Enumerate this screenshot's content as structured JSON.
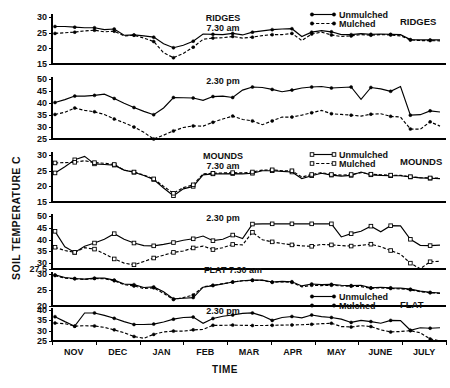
{
  "figure": {
    "y_axis_title": "SOIL TEMPERATURE C",
    "x_axis_title": "TIME",
    "x_tick_labels": [
      "NOV",
      "DEC",
      "JAN",
      "FEB",
      "MAR",
      "APR",
      "MAY",
      "JUNE",
      "JULY"
    ],
    "legend": {
      "unmulched": "Unmulched",
      "mulched": "Mulched"
    },
    "group_labels": {
      "ridges": "RIDGES",
      "mounds": "MOUNDS",
      "flat": "FLAT"
    },
    "panel_titles": {
      "ridges_am": "RIDGES\n7.30 am",
      "ridges_pm": "2.30 pm",
      "mounds_am": "MOUNDS\n7.30 am",
      "mounds_pm": "2.30 pm",
      "flat_am": "FLAT 7.30 am",
      "flat_pm": "2.30 pm"
    },
    "ink_color": "#000000",
    "background_color": "#ffffff"
  },
  "chart_data": {
    "type": "line",
    "xlabel": "TIME",
    "ylabel": "SOIL TEMPERATURE C",
    "grid": false,
    "legend_position": "top-right of each group",
    "x_categories": [
      "NOV",
      "DEC",
      "JAN",
      "FEB",
      "MAR",
      "APR",
      "MAY",
      "JUNE",
      "JULY"
    ],
    "x_range": [
      0,
      39
    ],
    "panels": [
      {
        "id": "ridges_am",
        "title": "RIDGES 7.30 am",
        "group": "RIDGES",
        "time_of_day": "7.30 am",
        "marker": "filled",
        "ylim": [
          15,
          31
        ],
        "yticks": [
          30,
          25,
          20,
          15
        ],
        "series": [
          {
            "name": "Unmulched",
            "style": "solid",
            "values": [
              27.0,
              27.0,
              26.8,
              26.6,
              26.6,
              26.0,
              26.2,
              24.2,
              24.3,
              24.0,
              23.6,
              21.5,
              20.2,
              21.0,
              22.3,
              24.6,
              24.5,
              24.4,
              24.8,
              24.3,
              25.2,
              25.6,
              26.0,
              26.2,
              26.3,
              23.8,
              25.2,
              25.7,
              25.3,
              24.4,
              24.4,
              24.7,
              24.5,
              24.6,
              24.5,
              24.4,
              22.8,
              22.7,
              22.7,
              22.7
            ]
          },
          {
            "name": "Mulched",
            "style": "dashed",
            "values": [
              24.8,
              25.0,
              25.2,
              25.6,
              25.8,
              25.3,
              25.5,
              24.0,
              24.2,
              23.3,
              22.2,
              18.6,
              17.0,
              18.4,
              20.4,
              22.9,
              23.3,
              23.4,
              23.8,
              23.3,
              23.6,
              24.1,
              24.4,
              24.4,
              24.8,
              22.5,
              24.6,
              25.2,
              24.3,
              23.8,
              24.0,
              24.4,
              24.2,
              24.4,
              24.3,
              24.0,
              22.7,
              22.5,
              22.5,
              22.4
            ]
          }
        ]
      },
      {
        "id": "ridges_pm",
        "title": "2.30 pm",
        "group": "RIDGES",
        "time_of_day": "2.30 pm",
        "marker": "filled",
        "ylim": [
          25,
          51
        ],
        "yticks": [
          50,
          45,
          40,
          35,
          30,
          25
        ],
        "series": [
          {
            "name": "Unmulched",
            "style": "solid",
            "values": [
              40.3,
              41.5,
              43.0,
              43.0,
              43.3,
              43.8,
              42.0,
              40.0,
              38.2,
              36.6,
              35.2,
              38.0,
              42.4,
              42.3,
              42.2,
              41.2,
              42.8,
              43.0,
              42.4,
              45.5,
              46.8,
              46.6,
              45.8,
              44.8,
              45.5,
              46.4,
              46.8,
              47.0,
              46.4,
              46.6,
              46.8,
              41.6,
              46.6,
              46.0,
              45.0,
              47.0,
              35.0,
              35.2,
              36.8,
              36.3
            ]
          },
          {
            "name": "Mulched",
            "style": "dashed",
            "values": [
              35.3,
              36.2,
              38.0,
              37.0,
              36.4,
              35.3,
              33.4,
              31.8,
              30.0,
              27.8,
              25.0,
              26.6,
              28.4,
              29.8,
              30.5,
              30.4,
              32.0,
              33.4,
              34.6,
              33.2,
              32.6,
              31.0,
              32.6,
              34.2,
              34.2,
              35.0,
              36.0,
              37.0,
              35.6,
              35.3,
              35.0,
              34.6,
              35.4,
              35.6,
              34.5,
              34.2,
              29.2,
              29.1,
              32.2,
              30.4
            ]
          }
        ]
      },
      {
        "id": "mounds_am",
        "title": "MOUNDS 7.30 am",
        "group": "MOUNDS",
        "time_of_day": "7.30 am",
        "marker": "open",
        "ylim": [
          15,
          31
        ],
        "yticks": [
          30,
          25,
          20,
          15
        ],
        "series": [
          {
            "name": "Unmulched",
            "style": "solid",
            "values": [
              24.3,
              26.3,
              28.5,
              29.6,
              27.2,
              27.0,
              26.8,
              25.2,
              24.5,
              23.5,
              22.2,
              19.5,
              17.0,
              19.2,
              20.0,
              23.7,
              24.0,
              24.0,
              24.1,
              24.0,
              24.2,
              25.0,
              25.0,
              24.8,
              24.6,
              22.5,
              23.4,
              24.2,
              23.6,
              23.3,
              23.5,
              24.6,
              23.7,
              23.5,
              23.4,
              23.4,
              23.0,
              22.7,
              22.6,
              22.5
            ]
          },
          {
            "name": "Mulched",
            "style": "dashed",
            "values": [
              27.5,
              27.6,
              27.7,
              28.2,
              27.6,
              27.4,
              27.0,
              25.2,
              24.6,
              23.6,
              22.4,
              20.0,
              17.8,
              19.6,
              20.5,
              24.0,
              24.2,
              24.3,
              24.4,
              24.3,
              24.6,
              25.2,
              25.3,
              25.0,
              25.0,
              23.0,
              23.8,
              24.4,
              23.8,
              23.6,
              23.8,
              24.4,
              23.9,
              23.7,
              23.6,
              23.5,
              23.1,
              22.8,
              22.7,
              22.6
            ]
          }
        ]
      },
      {
        "id": "mounds_pm",
        "title": "2.30 pm",
        "group": "MOUNDS",
        "time_of_day": "2.30 pm",
        "marker": "open",
        "ylim": [
          27.5,
          51
        ],
        "yticks": [
          50,
          45,
          40,
          35,
          30,
          27.5
        ],
        "series": [
          {
            "name": "Unmulched",
            "style": "solid",
            "values": [
              43.6,
              37.0,
              34.6,
              37.2,
              38.6,
              40.2,
              42.6,
              40.2,
              38.6,
              37.5,
              37.4,
              38.0,
              38.8,
              39.8,
              40.4,
              41.6,
              39.6,
              40.2,
              42.0,
              40.5,
              46.7,
              46.8,
              46.8,
              46.8,
              46.8,
              46.8,
              46.8,
              46.8,
              46.8,
              41.2,
              42.6,
              43.6,
              45.8,
              43.4,
              46.0,
              45.9,
              40.2,
              37.6,
              37.5,
              37.7
            ]
          },
          {
            "name": "Mulched",
            "style": "dashed",
            "values": [
              36.8,
              35.4,
              34.6,
              36.6,
              36.0,
              34.0,
              31.8,
              30.0,
              29.3,
              30.7,
              32.2,
              33.4,
              34.6,
              35.2,
              36.5,
              37.3,
              35.8,
              36.6,
              38.0,
              37.8,
              43.2,
              40.0,
              39.1,
              38.4,
              37.8,
              37.4,
              37.2,
              38.0,
              37.8,
              37.5,
              37.3,
              37.6,
              38.1,
              37.0,
              35.4,
              33.8,
              30.0,
              27.6,
              30.6,
              30.8
            ]
          }
        ]
      },
      {
        "id": "flat_am",
        "title": "FLAT 7.30 am",
        "group": "FLAT",
        "time_of_day": "7.30 am",
        "marker": "filled",
        "ylim": [
          20,
          30.5
        ],
        "yticks": [
          30,
          25,
          20
        ],
        "series": [
          {
            "name": "Unmulched",
            "style": "solid",
            "values": [
              29.6,
              28.8,
              28.5,
              28.3,
              28.6,
              28.6,
              28.0,
              26.8,
              26.6,
              25.7,
              25.9,
              24.4,
              22.2,
              22.4,
              22.6,
              25.8,
              26.3,
              26.8,
              27.4,
              27.8,
              28.0,
              28.0,
              27.4,
              27.6,
              27.5,
              26.2,
              26.8,
              26.6,
              26.7,
              26.4,
              26.3,
              26.4,
              25.6,
              25.8,
              25.6,
              25.5,
              25.2,
              24.6,
              24.2,
              24.0
            ]
          },
          {
            "name": "Mulched",
            "style": "dashed",
            "values": [
              29.4,
              28.6,
              28.4,
              28.2,
              28.5,
              28.4,
              27.8,
              26.6,
              26.2,
              25.4,
              25.6,
              23.9,
              22.0,
              22.6,
              23.4,
              25.9,
              26.4,
              26.9,
              27.4,
              27.8,
              27.9,
              27.9,
              27.3,
              27.5,
              27.3,
              25.9,
              26.4,
              26.3,
              26.4,
              26.2,
              26.1,
              26.0,
              25.5,
              25.6,
              25.4,
              25.3,
              25.0,
              24.4,
              24.1,
              23.9
            ]
          }
        ]
      },
      {
        "id": "flat_pm",
        "title": "2.30 pm",
        "group": "FLAT",
        "time_of_day": "2.30 pm",
        "marker": "filled",
        "ylim": [
          25,
          41
        ],
        "yticks": [
          40,
          35,
          30,
          25
        ],
        "series": [
          {
            "name": "Unmulched",
            "style": "solid",
            "values": [
              36.8,
              34.4,
              32.2,
              38.6,
              38.6,
              37.4,
              36.0,
              34.4,
              33.0,
              33.0,
              33.2,
              34.2,
              35.6,
              36.4,
              36.6,
              33.6,
              35.9,
              37.0,
              37.6,
              38.4,
              38.6,
              37.2,
              35.0,
              36.4,
              36.9,
              36.2,
              37.6,
              36.8,
              36.4,
              35.6,
              34.0,
              35.0,
              34.4,
              33.6,
              35.0,
              34.9,
              30.2,
              31.4,
              31.2,
              31.4
            ]
          },
          {
            "name": "Mulched",
            "style": "dashed",
            "values": [
              33.7,
              33.4,
              32.2,
              32.4,
              32.3,
              31.6,
              30.4,
              29.0,
              27.2,
              26.3,
              28.2,
              29.4,
              29.8,
              29.8,
              30.4,
              30.6,
              32.6,
              32.6,
              32.7,
              32.6,
              32.5,
              32.5,
              32.6,
              32.7,
              32.8,
              32.9,
              33.1,
              33.4,
              33.6,
              32.0,
              31.8,
              32.4,
              32.0,
              30.4,
              29.4,
              29.6,
              30.0,
              29.0,
              26.0,
              25.1
            ]
          }
        ]
      }
    ]
  }
}
